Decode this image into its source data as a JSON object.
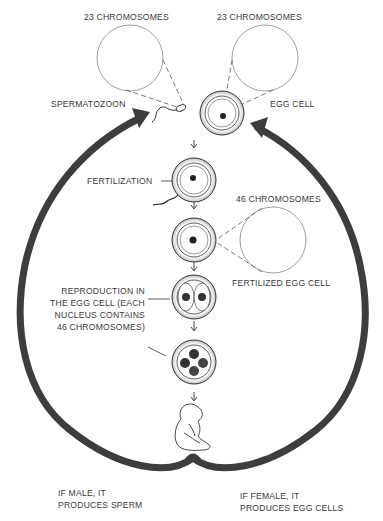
{
  "labels": {
    "sperm_chromosomes": "23 CHROMOSOMES",
    "egg_chromosomes": "23 CHROMOSOMES",
    "spermatozoon": "SPERMATOZOON",
    "egg_cell": "EGG CELL",
    "fertilization": "FERTILIZATION",
    "fertilized_chromosomes": "46 CHROMOSOMES",
    "fertilized_egg_cell": "FERTILIZED EGG CELL",
    "reproduction": "REPRODUCTION IN\nTHE EGG CELL (EACH\nNUCLEUS CONTAINS\n46 CHROMOSOMES)",
    "male": "IF MALE, IT\nPRODUCES SPERM",
    "female": "IF FEMALE, IT\nPRODUCES EGG CELLS"
  },
  "stages": [
    "spermatozoon + egg cell",
    "fertilization",
    "fertilized egg cell",
    "two-cell division",
    "four-cell division",
    "embryo"
  ],
  "colors": {
    "arrow": "#3d3d3d",
    "line": "#555555",
    "text": "#3a3a3a",
    "background": "#ffffff"
  }
}
